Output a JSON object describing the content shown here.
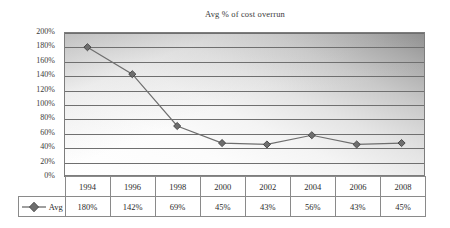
{
  "chart_data": {
    "type": "line",
    "title": "Avg % of cost overrun",
    "xlabel": "",
    "ylabel": "",
    "categories": [
      "1994",
      "1996",
      "1998",
      "2000",
      "2002",
      "2004",
      "2006",
      "2008"
    ],
    "series": [
      {
        "name": "Avg",
        "values": [
          180,
          142,
          69,
          45,
          43,
          56,
          43,
          45
        ],
        "value_labels": [
          "180%",
          "142%",
          "69%",
          "45%",
          "43%",
          "56%",
          "43%",
          "45%"
        ],
        "marker": "diamond",
        "color": "#6e6e6e"
      }
    ],
    "ylim": [
      0,
      200
    ],
    "ytick_step": 20,
    "ytick_labels": [
      "200%",
      "180%",
      "160%",
      "140%",
      "120%",
      "100%",
      "80%",
      "60%",
      "40%",
      "20%",
      "0%"
    ],
    "grid": true,
    "legend_position": "data-table-left",
    "data_table_visible": true,
    "plot_background": "gray-diagonal-gradient",
    "gridline_color": "#6f6f6f",
    "axis_color": "#6f6f6f"
  },
  "legend": {
    "label": "Avg",
    "marker_icon": "diamond-marker-icon"
  }
}
